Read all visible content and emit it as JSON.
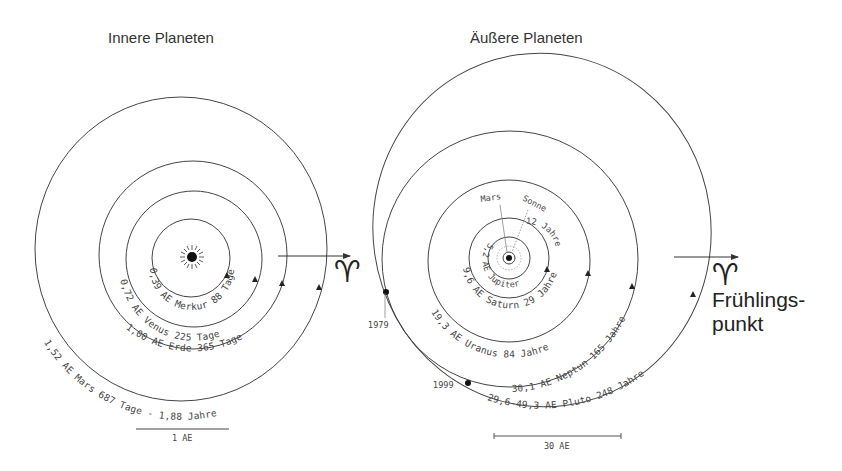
{
  "inner": {
    "title": "Innere Planeten",
    "orbits": [
      {
        "name": "Merkur",
        "label": "0,39 AE Merkur 88 Tage"
      },
      {
        "name": "Venus",
        "label": "0,72 AE Venus 225 Tage"
      },
      {
        "name": "Erde",
        "label": "1,00 AE Erde 365 Tage"
      },
      {
        "name": "Mars",
        "label": "1,52 AE Mars 687 Tage - 1,88 Jahre"
      }
    ],
    "scale_label": "1 AE",
    "vernal_symbol": "♈"
  },
  "outer": {
    "title": "Äußere Planeten",
    "sun_label": "Sonne",
    "mars_label": "Mars",
    "orbits": [
      {
        "name": "Jupiter",
        "label_a": "5,2 AE Jupiter",
        "label_b": "12 Jahre"
      },
      {
        "name": "Saturn",
        "label": "9,6 AE Saturn 29 Jahre"
      },
      {
        "name": "Uranus",
        "label": "19,3 AE Uranus 84 Jahre"
      },
      {
        "name": "Neptun",
        "label": "30,1 AE Neptun 165 Jahre"
      },
      {
        "name": "Pluto",
        "label": "29,6-49,3 AE Pluto 248 Jahre"
      }
    ],
    "years": [
      "1979",
      "1999"
    ],
    "scale_label": "30 AE",
    "vernal_symbol": "♈",
    "vernal_label_line1": "Frühlings-",
    "vernal_label_line2": "punkt"
  }
}
